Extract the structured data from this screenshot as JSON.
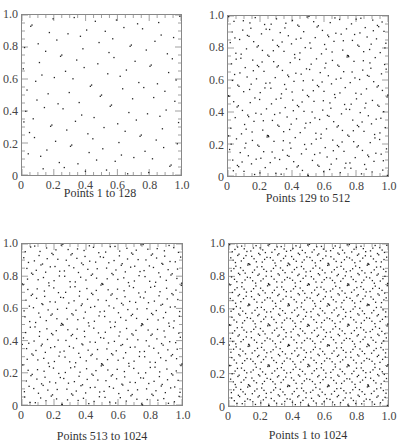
{
  "chart_data": [
    {
      "type": "scatter",
      "title": "",
      "caption": "Points 1 to 128",
      "generator": "sobol-2d",
      "point_range": [
        1,
        128
      ],
      "xlabel": "",
      "ylabel": "",
      "xlim": [
        0,
        1.0
      ],
      "ylim": [
        0,
        1.0
      ],
      "xticks": [
        "0",
        "0.2",
        "0.4",
        "0.6",
        "0.8",
        "1.0"
      ],
      "yticks": [
        "0",
        "0.2",
        "0.4",
        "0.6",
        "0.8",
        "1.0"
      ],
      "grid": false,
      "frame": {
        "left": 21,
        "top": 14,
        "width": 161,
        "height": 162
      },
      "caption_pos": {
        "left": 0,
        "top": 186
      }
    },
    {
      "type": "scatter",
      "title": "",
      "caption": "Points 129 to 512",
      "generator": "sobol-2d",
      "point_range": [
        129,
        512
      ],
      "xlabel": "",
      "ylabel": "",
      "xlim": [
        0,
        1.0
      ],
      "ylim": [
        0,
        1.0
      ],
      "xticks": [
        "0",
        "0.2",
        "0.4",
        "0.6",
        "0.8",
        "1.0"
      ],
      "yticks": [
        "0",
        "0.2",
        "0.4",
        "0.6",
        "0.8",
        "1.0"
      ],
      "grid": false,
      "frame": {
        "left": 227,
        "top": 15,
        "width": 162,
        "height": 162
      },
      "caption_pos": {
        "left": 208,
        "top": 191
      }
    },
    {
      "type": "scatter",
      "title": "",
      "caption": "Points 513 to 1024",
      "generator": "sobol-2d",
      "point_range": [
        513,
        1024
      ],
      "xlabel": "",
      "ylabel": "",
      "xlim": [
        0,
        1.0
      ],
      "ylim": [
        0,
        1.0
      ],
      "xticks": [
        "0",
        "0.2",
        "0.4",
        "0.6",
        "0.8",
        "1.0"
      ],
      "yticks": [
        "0",
        "0.2",
        "0.4",
        "0.6",
        "0.8",
        "1.0"
      ],
      "grid": false,
      "frame": {
        "left": 21,
        "top": 243,
        "width": 162,
        "height": 163
      },
      "caption_pos": {
        "left": 2,
        "top": 429
      }
    },
    {
      "type": "scatter",
      "title": "",
      "caption": "Points 1 to 1024",
      "generator": "sobol-2d",
      "point_range": [
        1,
        1024
      ],
      "xlabel": "",
      "ylabel": "",
      "xlim": [
        0,
        1.0
      ],
      "ylim": [
        0,
        1.0
      ],
      "xticks": [
        "0",
        "0.2",
        "0.4",
        "0.6",
        "0.8",
        "1.0"
      ],
      "yticks": [
        "0",
        "0.2",
        "0.4",
        "0.6",
        "0.8",
        "1.0"
      ],
      "grid": false,
      "frame": {
        "left": 228,
        "top": 243,
        "width": 161,
        "height": 164
      },
      "caption_pos": {
        "left": 208,
        "top": 428
      }
    }
  ],
  "style": {
    "point_color": "#222222",
    "frame_color": "#888888",
    "tick_color": "#888888",
    "text_color": "#333333"
  }
}
